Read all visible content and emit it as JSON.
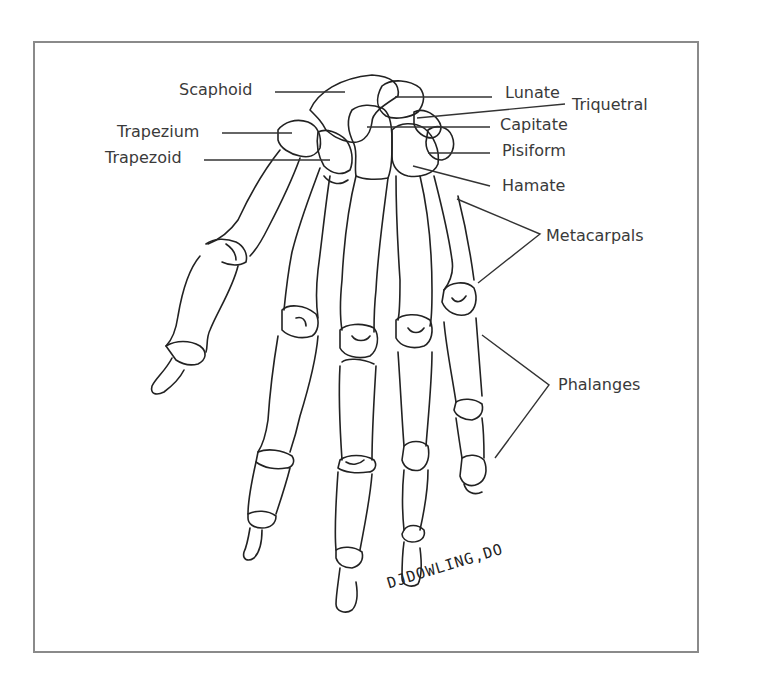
{
  "figure": {
    "labels": {
      "scaphoid": "Scaphoid",
      "trapezium": "Trapezium",
      "trapezoid": "Trapezoid",
      "lunate": "Lunate",
      "triquetral": "Triquetral",
      "capitate": "Capitate",
      "pisiform": "Pisiform",
      "hamate": "Hamate",
      "metacarpals": "Metacarpals",
      "phalanges": "Phalanges"
    },
    "signature": "DJDOWLING,DO",
    "colors": {
      "line": "#222222",
      "text": "#3a3a3a",
      "frame": "#8a8a8a",
      "background": "#ffffff"
    }
  }
}
